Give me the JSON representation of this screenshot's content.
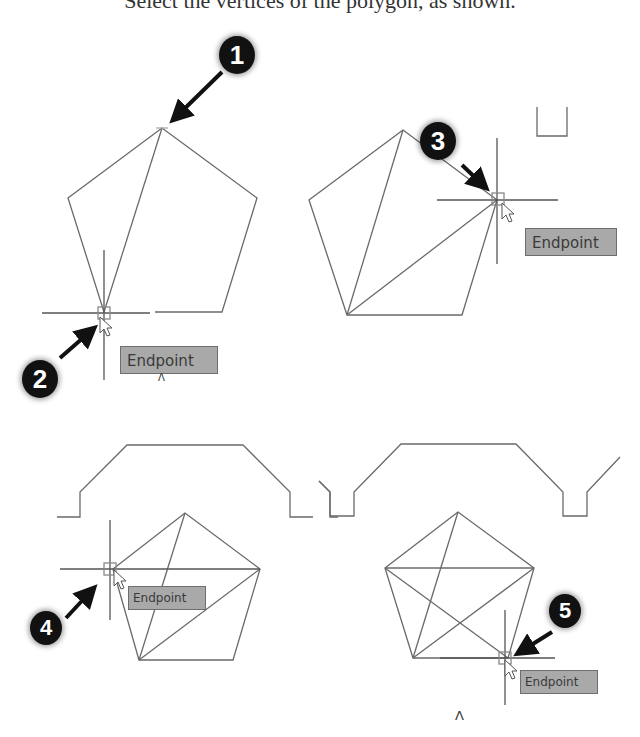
{
  "caption": "Select the vertices of the polygon, as shown.",
  "tooltip_label": "Endpoint",
  "markers": [
    "1",
    "2",
    "3",
    "4",
    "5"
  ],
  "caret": "Λ",
  "colors": {
    "line": "#6a6a6a",
    "tooltip_bg": "#a9a9a9",
    "tooltip_border": "#6e6e6e",
    "marker_bg": "#111111",
    "marker_text": "#ffffff"
  },
  "panels": [
    {
      "id": 1,
      "step_markers": [
        "1",
        "2"
      ],
      "tooltip": "Endpoint"
    },
    {
      "id": 2,
      "step_markers": [
        "3"
      ],
      "tooltip": "Endpoint"
    },
    {
      "id": 3,
      "step_markers": [
        "4"
      ],
      "tooltip": "Endpoint"
    },
    {
      "id": 4,
      "step_markers": [
        "5"
      ],
      "tooltip": "Endpoint"
    }
  ]
}
